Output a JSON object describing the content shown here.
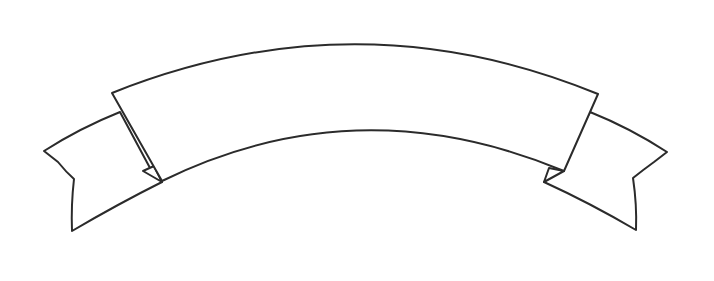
{
  "image": {
    "subject": "blank curved ribbon banner",
    "background_color": "#ffffff",
    "outline_color": "#2b2b2b",
    "fill_color": "#ffffff",
    "banner_text": ""
  },
  "ribbon": {
    "parts": [
      "left-tail",
      "left-fold",
      "main-band",
      "right-fold",
      "right-tail"
    ]
  }
}
